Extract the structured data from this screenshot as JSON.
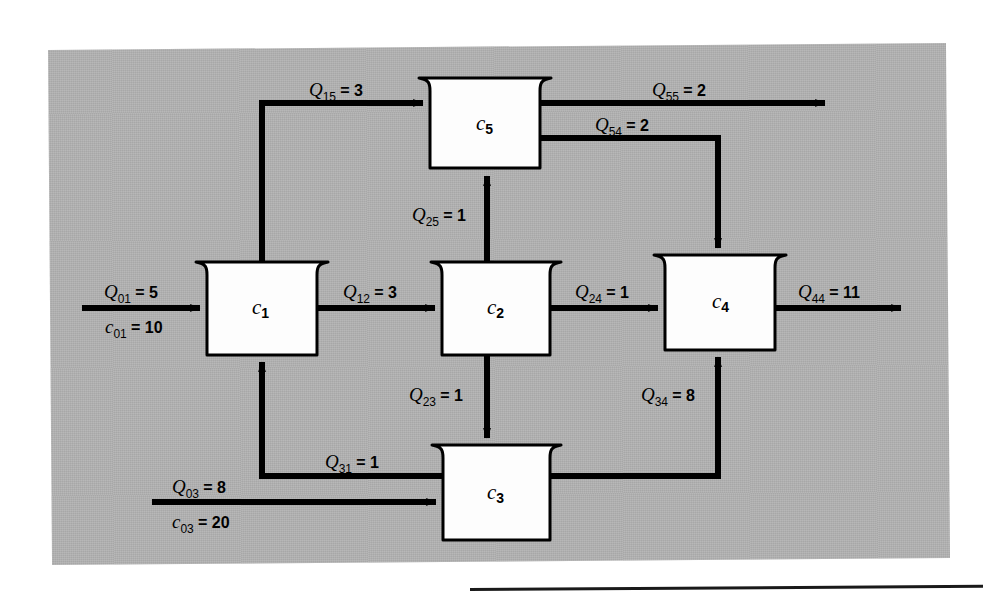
{
  "figure": {
    "type": "process-flow-diagram",
    "panel_color": "#b3b3b3",
    "line_color": "#000000",
    "box_fill": "#ffffff"
  },
  "reactors": [
    {
      "id": "c1",
      "label_base": "c",
      "label_sub": "1",
      "x": 207,
      "y": 262,
      "w": 110,
      "h": 93
    },
    {
      "id": "c2",
      "label_base": "c",
      "label_sub": "2",
      "x": 442,
      "y": 262,
      "w": 108,
      "h": 93
    },
    {
      "id": "c3",
      "label_base": "c",
      "label_sub": "3",
      "x": 443,
      "y": 445,
      "w": 107,
      "h": 95
    },
    {
      "id": "c4",
      "label_base": "c",
      "label_sub": "4",
      "x": 665,
      "y": 255,
      "w": 110,
      "h": 95
    },
    {
      "id": "c5",
      "label_base": "c",
      "label_sub": "5",
      "x": 430,
      "y": 78,
      "w": 110,
      "h": 90
    }
  ],
  "flows": [
    {
      "id": "Q01",
      "symbol": "Q",
      "sub": "01",
      "eq": "=",
      "value": "5",
      "from": "inlet",
      "to": "c1"
    },
    {
      "id": "c01",
      "symbol": "c",
      "sub": "01",
      "eq": "=",
      "value": "10",
      "from": "inlet",
      "to": "c1",
      "kind": "concentration"
    },
    {
      "id": "Q03",
      "symbol": "Q",
      "sub": "03",
      "eq": "=",
      "value": "8",
      "from": "inlet",
      "to": "c3"
    },
    {
      "id": "c03",
      "symbol": "c",
      "sub": "03",
      "eq": "=",
      "value": "20",
      "from": "inlet",
      "to": "c3",
      "kind": "concentration"
    },
    {
      "id": "Q12",
      "symbol": "Q",
      "sub": "12",
      "eq": "=",
      "value": "3",
      "from": "c1",
      "to": "c2"
    },
    {
      "id": "Q15",
      "symbol": "Q",
      "sub": "15",
      "eq": "=",
      "value": "3",
      "from": "c1",
      "to": "c5"
    },
    {
      "id": "Q23",
      "symbol": "Q",
      "sub": "23",
      "eq": "=",
      "value": "1",
      "from": "c2",
      "to": "c3"
    },
    {
      "id": "Q24",
      "symbol": "Q",
      "sub": "24",
      "eq": "=",
      "value": "1",
      "from": "c2",
      "to": "c4"
    },
    {
      "id": "Q25",
      "symbol": "Q",
      "sub": "25",
      "eq": "=",
      "value": "1",
      "from": "c2",
      "to": "c5"
    },
    {
      "id": "Q31",
      "symbol": "Q",
      "sub": "31",
      "eq": "=",
      "value": "1",
      "from": "c3",
      "to": "c1"
    },
    {
      "id": "Q34",
      "symbol": "Q",
      "sub": "34",
      "eq": "=",
      "value": "8",
      "from": "c3",
      "to": "c4"
    },
    {
      "id": "Q44",
      "symbol": "Q",
      "sub": "44",
      "eq": "=",
      "value": "11",
      "from": "c4",
      "to": "outlet"
    },
    {
      "id": "Q54",
      "symbol": "Q",
      "sub": "54",
      "eq": "=",
      "value": "2",
      "from": "c5",
      "to": "c4"
    },
    {
      "id": "Q55",
      "symbol": "Q",
      "sub": "55",
      "eq": "=",
      "value": "2",
      "from": "c5",
      "to": "outlet"
    }
  ]
}
